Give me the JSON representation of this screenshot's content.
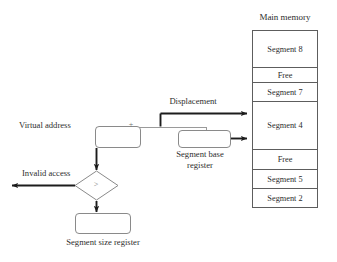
{
  "diagram": {
    "memory": {
      "header": "Main memory",
      "cells": [
        {
          "label": "Segment 8",
          "height": 38
        },
        {
          "label": "Free",
          "height": 15
        },
        {
          "label": "Segment 7",
          "height": 19
        },
        {
          "label": "Segment 4",
          "height": 48
        },
        {
          "label": "Free",
          "height": 20
        },
        {
          "label": "Segment 5",
          "height": 19
        },
        {
          "label": "Segment 2",
          "height": 19
        }
      ]
    },
    "labels": {
      "virtual_address": "Virtual address",
      "displacement": "Displacement",
      "segment_base_register_line1": "Segment base",
      "segment_base_register_line2": "register",
      "invalid_access": "Invalid access",
      "segment_size_register": "Segment size register",
      "plus": "+",
      "compare_operator": ">"
    },
    "colors": {
      "line": "#5d5d5d",
      "box_border": "#8a8a8a",
      "arrow": "#1c1c1c",
      "thin_line": "#9a9a9a",
      "text": "#2e2e2e"
    }
  }
}
